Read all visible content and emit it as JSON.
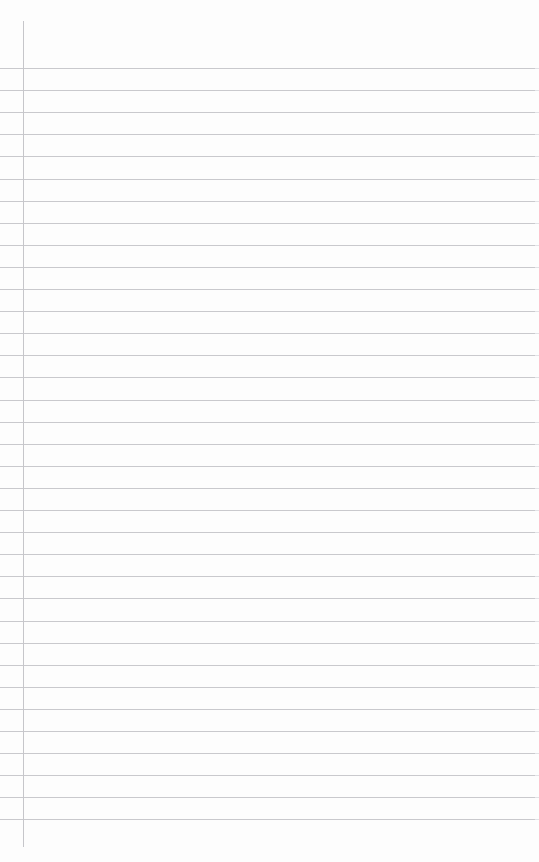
{
  "page": {
    "width": 539,
    "height": 862,
    "background_color": "#fdfdfd",
    "content_text": ""
  },
  "paper": {
    "sheet_name": "blank-lined-sheet",
    "rule_color": "#c9c9cd",
    "rule_fade_color": "#e2e2e6",
    "margin_rule_color": "#c6c6ca",
    "rule_thickness_px": 1,
    "rule_count": 35,
    "first_rule_y": 68,
    "rule_spacing_px": 22.1,
    "rule_start_x": 0,
    "rule_end_x": 536,
    "margin_rule_x": 23,
    "margin_rule_top_y": 21,
    "margin_rule_bottom_y": 847,
    "rule_y_positions": [
      68,
      90.1,
      112.2,
      134.3,
      156.4,
      178.5,
      200.6,
      222.7,
      244.8,
      266.9,
      289.0,
      311.1,
      333.2,
      355.3,
      377.4,
      399.5,
      421.6,
      443.7,
      465.8,
      487.9,
      510.0,
      532.1,
      554.2,
      576.3,
      598.4,
      620.5,
      642.6,
      664.7,
      686.8,
      708.9,
      731.0,
      753.1,
      775.2,
      797.3,
      819.4
    ]
  },
  "writing": {
    "lines": [
      "",
      "",
      "",
      "",
      "",
      "",
      "",
      "",
      "",
      "",
      "",
      "",
      "",
      "",
      "",
      "",
      "",
      "",
      "",
      "",
      "",
      "",
      "",
      "",
      "",
      "",
      "",
      "",
      "",
      "",
      "",
      "",
      "",
      "",
      ""
    ]
  }
}
